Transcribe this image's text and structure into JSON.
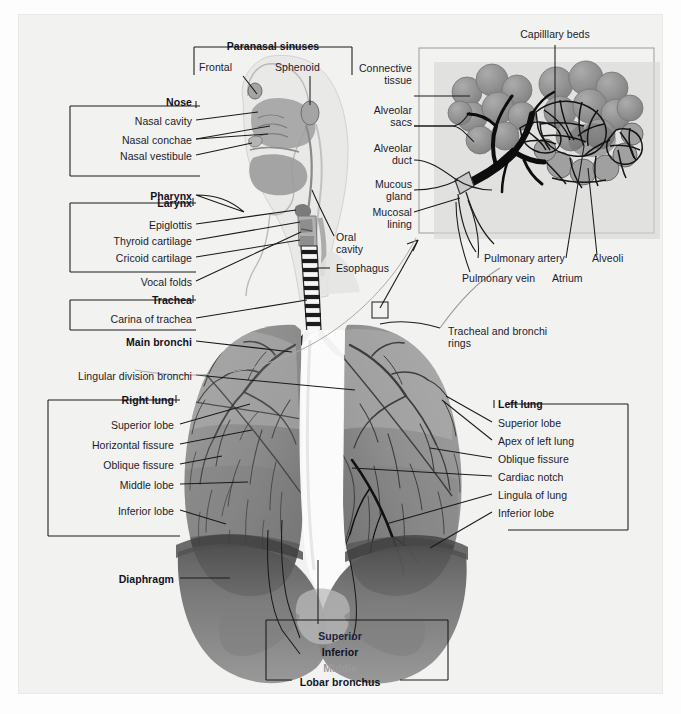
{
  "figure": {
    "background_color": "#f2f2f1",
    "line_color": "#1a1a1a",
    "text_color": "#1b1b2b",
    "muted_text_color": "#9a9a9a"
  },
  "groups": {
    "paranasal_sinuses": {
      "heading": "Paranasal sinuses",
      "items": [
        "Frontal",
        "Sphenoid"
      ]
    },
    "nose": {
      "heading": "Nose",
      "items": [
        "Nasal cavity",
        "Nasal conchae",
        "Nasal vestibule"
      ]
    },
    "pharynx": {
      "heading": "Pharynx"
    },
    "larynx": {
      "heading": "Larynx",
      "items": [
        "Epiglottis",
        "Thyroid cartilage",
        "Cricoid cartilage"
      ]
    },
    "vocal_folds": {
      "heading": "Vocal folds"
    },
    "trachea": {
      "heading": "Trachea",
      "items": [
        "Carina of trachea"
      ]
    },
    "main_bronchi": {
      "heading": "Main bronchi"
    },
    "lingular": {
      "heading": "Lingular division bronchi"
    },
    "right_lung": {
      "heading": "Right lung",
      "items": [
        "Superior lobe",
        "Horizontal fissure",
        "Oblique fissure",
        "Middle lobe",
        "Inferior lobe"
      ]
    },
    "left_lung": {
      "heading": "Left lung",
      "items": [
        "Superior lobe",
        "Apex of left lung",
        "Oblique fissure",
        "Cardiac notch",
        "Lingula of lung",
        "Inferior lobe"
      ]
    },
    "diaphragm": {
      "heading": "Diaphragm"
    },
    "lobar_bronchus": {
      "heading": "Lobar bronchus",
      "items": [
        "Superior",
        "Inferior",
        "Middle"
      ]
    }
  },
  "inset": {
    "capillary_beds": "Capilllary beds",
    "connective_tissue_l1": "Connective",
    "connective_tissue_l2": "tissue",
    "alveolar_sacs_l1": "Alveolar",
    "alveolar_sacs_l2": "sacs",
    "alveolar_duct_l1": "Alveolar",
    "alveolar_duct_l2": "duct",
    "mucous_gland_l1": "Mucous",
    "mucous_gland_l2": "gland",
    "mucosal_lining_l1": "Mucosal",
    "mucosal_lining_l2": "lining",
    "pulmonary_artery": "Pulmonary artery",
    "pulmonary_vein": "Pulmonary vein",
    "alveoli": "Alveoli",
    "atrium": "Atrium"
  },
  "head": {
    "oral_cavity_l1": "Oral",
    "oral_cavity_l2": "cavity",
    "esophagus": "Esophagus"
  },
  "misc": {
    "tracheal_rings_l1": "Tracheal and bronchi",
    "tracheal_rings_l2": "rings"
  }
}
